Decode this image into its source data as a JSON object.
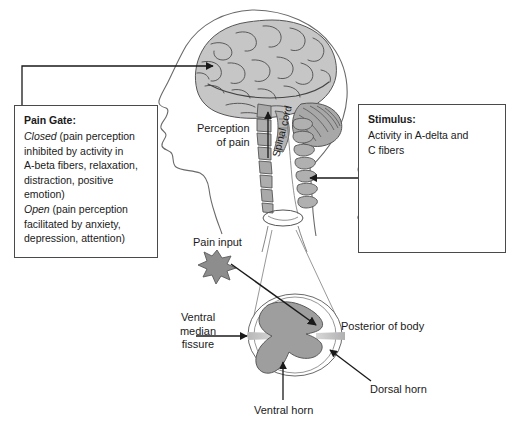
{
  "figure": {
    "bottom_caption_partial": ""
  },
  "pain_gate_box": {
    "title": "Pain Gate:",
    "lines": [
      {
        "lead": "Closed",
        "lead_style": "italic",
        "rest": " (pain perception"
      },
      {
        "lead": "",
        "lead_style": "normal",
        "rest": "inhibited by activity in"
      },
      {
        "lead": "",
        "lead_style": "normal",
        "rest": "A-beta fibers, relaxation,"
      },
      {
        "lead": "",
        "lead_style": "normal",
        "rest": "distraction, positive"
      },
      {
        "lead": "",
        "lead_style": "normal",
        "rest": "emotion)"
      },
      {
        "lead": "Open",
        "lead_style": "italic",
        "rest": " (pain perception"
      },
      {
        "lead": "",
        "lead_style": "normal",
        "rest": "facilitated by anxiety,"
      },
      {
        "lead": "",
        "lead_style": "normal",
        "rest": "depression, attention)"
      }
    ]
  },
  "stimulus_box": {
    "title": "Stimulus:",
    "lines": [
      {
        "lead": "",
        "lead_style": "normal",
        "rest": "Activity in A-delta and"
      },
      {
        "lead": "",
        "lead_style": "normal",
        "rest": "C fibers"
      }
    ]
  },
  "labels": {
    "perception_of_pain": "Perception\nof pain",
    "spinal_cord": "Spinal cord",
    "pain_input": "Pain input",
    "ventral_median_fissure": "Ventral\nmedian\nfissure",
    "posterior_of_body": "Posterior of body",
    "dorsal_horn": "Dorsal horn",
    "ventral_horn": "Ventral horn"
  },
  "colors": {
    "ink": "#1a1a1a",
    "outline": "#4a4a4a",
    "gray_matter": "#9a9a9a",
    "brain_fill": "#c6c6c6",
    "cerebellum_fill": "#a8a8a8",
    "vertebra_fill": "#b0b0b0",
    "star_fill": "#8d8d8d",
    "hand_outline": "#5e5e5e",
    "background": "#ffffff"
  }
}
